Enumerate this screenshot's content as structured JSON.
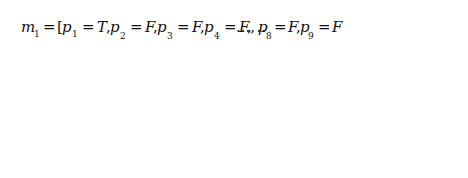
{
  "diagram": {
    "colors": {
      "stroke": "#111111",
      "background": "#ffffff"
    },
    "markings": [
      {
        "id": "m1",
        "label": "m",
        "label_sub": "1",
        "text_parts": [
          {
            "t": "m",
            "sub": "1"
          },
          {
            "t": " = [p",
            "sub": "1"
          },
          {
            "t": " = T, p",
            "sub": "2"
          },
          {
            "t": " = F, p",
            "sub": "3"
          },
          {
            "t": " = F, p",
            "sub": "4"
          },
          {
            "t": " = F, ..., p",
            "sub": "8"
          },
          {
            "t": " = F, p",
            "sub": "9"
          },
          {
            "t": " = F, p",
            "sub": "10"
          },
          {
            "t": " = T, p",
            "sub": "11"
          },
          {
            "t": " = F, ...]",
            "sub": ""
          }
        ],
        "places": [
          {
            "name": "p1",
            "value": "T",
            "circled": true
          },
          {
            "name": "p2",
            "value": "F",
            "circled": false
          },
          {
            "name": "p3",
            "value": "F",
            "circled": false
          },
          {
            "name": "p4",
            "value": "F",
            "circled": false
          },
          {
            "name": "p8",
            "value": "F",
            "circled": false
          },
          {
            "name": "p9",
            "value": "F",
            "circled": false
          },
          {
            "name": "p10",
            "value": "T",
            "circled": true
          },
          {
            "name": "p11",
            "value": "F",
            "circled": false
          }
        ]
      },
      {
        "id": "m3",
        "label": "m",
        "label_sub": "3",
        "places": [
          {
            "name": "p1",
            "value": "F",
            "circled": false
          },
          {
            "name": "p2",
            "value": "T",
            "circled": true
          },
          {
            "name": "p3",
            "value": "F",
            "circled": false
          },
          {
            "name": "p4",
            "value": "T",
            "circled": true
          },
          {
            "name": "p8",
            "value": "T",
            "circled": true
          },
          {
            "name": "p9",
            "value": "F",
            "circled": false
          },
          {
            "name": "p10",
            "value": "F",
            "circled": false
          },
          {
            "name": "p11",
            "value": "T",
            "circled": true
          }
        ]
      }
    ],
    "transitions": [
      {
        "id": "t1",
        "label": "t",
        "sub": "1",
        "inputs": [
          "p1"
        ],
        "outputs": [
          "p2",
          "p4"
        ]
      },
      {
        "id": "t4",
        "label": "t",
        "sub": "4",
        "inputs": [
          "p10"
        ],
        "outputs": [
          "p8",
          "p11"
        ]
      }
    ]
  },
  "text": {
    "m1_m": "m",
    "m1_sub": "1",
    "eq": "=",
    "bracket_open": "[",
    "bracket_close": "]",
    "m3_m": "m",
    "m3_sub": "3",
    "t1_t": "t",
    "t1_sub": "1",
    "t4_t": "t",
    "t4_sub": "4",
    "T": "T",
    "F": "F",
    "p": "p",
    "dots": "...",
    "s1": "1",
    "s2": "2",
    "s3": "3",
    "s4": "4",
    "s8": "8",
    "s9": "9",
    "s10": "10",
    "s11": "11"
  }
}
